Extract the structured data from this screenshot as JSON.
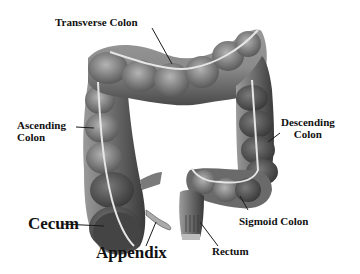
{
  "diagram": {
    "colors": {
      "background": "#ffffff",
      "tissue_dark": "#3e3e3e",
      "tissue_mid": "#6f6f6f",
      "tissue_light": "#a9a9a9",
      "taenia_band": "#e6e6e6",
      "label_text": "#111111",
      "leader_line": "#1a1a1a"
    },
    "labels": {
      "transverse_colon": "Transverse Colon",
      "ascending_colon_line1": "Ascending",
      "ascending_colon_line2": "Colon",
      "descending_colon_line1": "Descending",
      "descending_colon_line2": "Colon",
      "cecum": "Cecum",
      "appendix": "Appendix",
      "sigmoid_colon": "Sigmoid Colon",
      "rectum": "Rectum"
    }
  }
}
